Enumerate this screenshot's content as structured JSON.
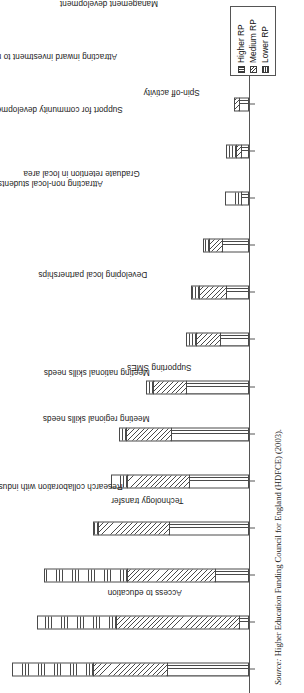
{
  "chart_data": {
    "type": "bar",
    "orientation": "horizontal",
    "stacked": true,
    "title": "",
    "subtitle": "",
    "xlabel": "",
    "ylabel": "",
    "grid": false,
    "legend_position": "top-right",
    "axis_units": "percentage of respondents (stacked)",
    "value_axis_range": [
      0,
      100
    ],
    "categories": [
      "Access to education",
      "Research collaboration with industry",
      "Technology transfer",
      "Meeting regional skills needs",
      "Meeting national skills needs",
      "Supporting SMEs",
      "Developing local partnerships",
      "Attracting non-local students to the region",
      "Graduate retention in local area",
      "Support for community development",
      "Attracting inward investment to region",
      "Spin-off activity",
      "Management development",
      "Strategic analysis of regional economy"
    ],
    "series": [
      {
        "name": "Higher RP",
        "pattern": "vertical-lines",
        "values": [
          34.5,
          4.1,
          14.3,
          33.6,
          25.1,
          32.6,
          26.4,
          12.0,
          9.7,
          11.3,
          3.2,
          3.5,
          4.1,
          0.0
        ]
      },
      {
        "name": "Medium RP",
        "pattern": "diagonal-hatch",
        "values": [
          31.1,
          52.0,
          37.3,
          29.9,
          26.4,
          19.5,
          14.2,
          10.4,
          11.5,
          5.8,
          0.0,
          2.3,
          2.8,
          0.0
        ]
      },
      {
        "name": "Lower RP",
        "pattern": "horizontal-lines",
        "values": [
          34.4,
          33.4,
          35.2,
          2.5,
          7.1,
          3.0,
          3.4,
          4.8,
          4.1,
          2.8,
          7.6,
          4.8,
          0.0,
          0.0
        ]
      }
    ],
    "totals": [
      100.0,
      89.5,
      86.8,
      66.0,
      58.6,
      55.1,
      44.0,
      27.2,
      25.3,
      19.9,
      10.8,
      10.6,
      6.9,
      0.0
    ]
  },
  "legend": {
    "entries": [
      {
        "label": "Higher RP",
        "swatch": "vertical-lines-swatch"
      },
      {
        "label": "Medium RP",
        "swatch": "diagonal-hatch-swatch"
      },
      {
        "label": "Lower RP",
        "swatch": "horizontal-lines-swatch"
      }
    ]
  },
  "source": {
    "label": "Source:",
    "text": "Higher Education Funding Council for England (HDFCE) (2003)."
  },
  "style": {
    "ink": "#4a4a4a",
    "paper": "#ffffff",
    "text": "#1a1a1a"
  }
}
